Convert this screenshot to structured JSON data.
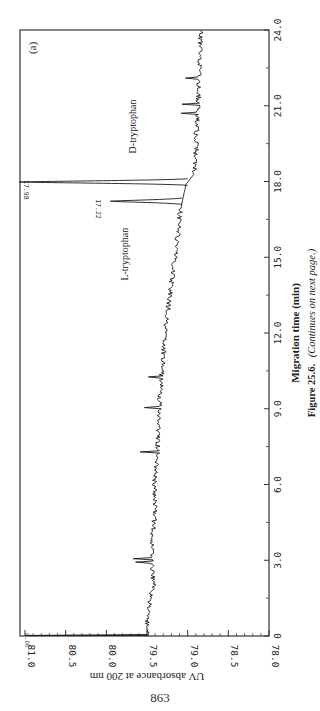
{
  "page": {
    "page_number": "863",
    "caption_label": "Figure 25.6.",
    "caption_note": "(Continues on next page.)",
    "panel_label": "(a)"
  },
  "chart_data": {
    "type": "line",
    "title": "",
    "panel": "(a)",
    "xlabel": "Migration time (min)",
    "ylabel": "UV absorbance at 200 nm",
    "xlim": [
      0,
      24.0
    ],
    "ylim": [
      78.0,
      81.0
    ],
    "x_ticks": [
      "0",
      "3.0",
      "6.0",
      "9.0",
      "12.0",
      "15.0",
      "18.0",
      "21.0",
      "24.0"
    ],
    "x_tick_values": [
      0,
      3,
      6,
      9,
      12,
      15,
      18,
      21,
      24
    ],
    "y_ticks": [
      "81.0",
      "80.5",
      "80.0",
      "79.5",
      "79.0",
      "78.5",
      "78.0"
    ],
    "y_tick_values": [
      81.0,
      80.5,
      80.0,
      79.5,
      79.0,
      78.5,
      78.0
    ],
    "grid": false,
    "orientation": "rotated 90° (time axis vertical, absorbance axis horizontal, reversed)",
    "baseline": {
      "x": [
        0,
        1,
        2,
        3,
        4,
        5,
        6,
        7,
        8,
        9,
        10,
        11,
        12,
        13,
        14,
        15,
        16,
        17,
        17.9,
        18.3,
        19,
        20,
        21,
        22,
        23,
        24
      ],
      "y": [
        79.5,
        79.49,
        79.42,
        79.45,
        79.43,
        79.4,
        79.41,
        79.38,
        79.36,
        79.35,
        79.33,
        79.3,
        79.28,
        79.24,
        79.2,
        79.15,
        79.12,
        79.08,
        79.02,
        78.92,
        78.9,
        78.89,
        78.87,
        78.86,
        78.85,
        78.84
      ]
    },
    "peaks": [
      {
        "name": "L-tryptophan",
        "time": 17.22,
        "time_label": "17.22",
        "apex": 79.95
      },
      {
        "name": "D-tryptophan",
        "time": 17.98,
        "time_label": "17.98",
        "apex": 81.0,
        "off_scale": true
      }
    ],
    "injection_spike": {
      "time": 0.0,
      "label": "0.00",
      "apex": 81.0
    },
    "annotations": [
      "L-tryptophan",
      "D-tryptophan",
      "17.22",
      "17.98"
    ]
  },
  "layout": {
    "frame": {
      "left": 20,
      "top": 30,
      "right": 269,
      "bottom": 636
    },
    "y_axis_px": {
      "v81": 25,
      "v78": 269
    },
    "colors": {
      "trace": "#1a1a1a",
      "frame": "#333333",
      "text": "#222222"
    }
  }
}
